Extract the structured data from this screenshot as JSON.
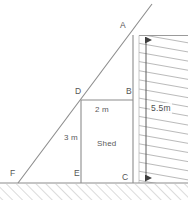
{
  "figure": {
    "type": "geometry-diagram",
    "stroke_color": "#8c8c8c",
    "hatch_color": "#b0b0b0",
    "text_color": "#5a5a5a",
    "background": "#ffffff",
    "width": 188,
    "height": 211
  },
  "points": [
    {
      "id": "A",
      "label": "A",
      "x": 133,
      "y": 35,
      "label_x": 120,
      "label_y": 21
    },
    {
      "id": "B",
      "label": "B",
      "x": 133,
      "y": 100,
      "label_x": 126,
      "label_y": 87
    },
    {
      "id": "C",
      "label": "C",
      "x": 133,
      "y": 183,
      "label_x": 122,
      "label_y": 173
    },
    {
      "id": "D",
      "label": "D",
      "x": 81,
      "y": 100,
      "label_x": 75,
      "label_y": 87
    },
    {
      "id": "E",
      "label": "E",
      "x": 81,
      "y": 183,
      "label_x": 74,
      "label_y": 169
    },
    {
      "id": "F",
      "label": "F",
      "x": 18,
      "y": 183,
      "label_x": 10,
      "label_y": 169
    }
  ],
  "dimensions": [
    {
      "id": "db",
      "label": "2 m",
      "x": 95,
      "y": 106,
      "measures": "D to B"
    },
    {
      "id": "de",
      "label": "3 m",
      "x": 64,
      "y": 134,
      "measures": "D to E"
    },
    {
      "id": "ac",
      "label": "5.5m",
      "x": 150,
      "y": 103,
      "measures": "A to C"
    }
  ],
  "region_labels": [
    {
      "id": "shed",
      "label": "Shed",
      "x": 97,
      "y": 140
    }
  ],
  "segments": [
    {
      "id": "ground",
      "from": "ground-left",
      "to": "ground-right",
      "note": "horizontal ground line"
    },
    {
      "id": "ramp-FA",
      "from": "F",
      "to": "A",
      "note": "inclined line through D extended past A"
    },
    {
      "id": "wall-AC",
      "from": "A",
      "to": "C",
      "note": "vertical wall face"
    },
    {
      "id": "post-DE",
      "from": "D",
      "to": "E",
      "note": "vertical shed front"
    },
    {
      "id": "roof-DB",
      "from": "D",
      "to": "B",
      "note": "horizontal shed top"
    }
  ],
  "hatching": [
    {
      "id": "wall-hatch",
      "orientation": "horizontal-slanted",
      "note": "wall solid to the right of AC"
    },
    {
      "id": "ground-hatch",
      "orientation": "diagonal",
      "note": "soil below the ground line"
    }
  ],
  "arrow": {
    "id": "height-arrow",
    "label": "5.5m",
    "direction": "double",
    "from_y": 36,
    "to_y": 182,
    "x": 146
  }
}
